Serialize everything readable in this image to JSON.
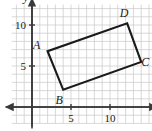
{
  "figure": {
    "type": "coordinate-grid-geometry",
    "axis_labels": {
      "x": "x",
      "y": "y"
    },
    "x_ticks": [
      {
        "value": 5,
        "label": "5"
      },
      {
        "value": 10,
        "label": "10"
      }
    ],
    "y_ticks": [
      {
        "value": 5,
        "label": "5"
      },
      {
        "value": 10,
        "label": "10"
      }
    ],
    "grid": true,
    "grid_color": "#c9c9c9",
    "axis_color": "#3a3a3a",
    "shape_color": "#1a1a1a",
    "shape": {
      "name": "rectangle ABCD",
      "vertices": [
        {
          "label": "A",
          "x": 2.0,
          "y": 6.8,
          "label_dx": -11,
          "label_dy": -2
        },
        {
          "label": "B",
          "x": 4.0,
          "y": 2.1,
          "label_dx": -4,
          "label_dy": 14
        },
        {
          "label": "C",
          "x": 14.0,
          "y": 5.5,
          "label_dx": 4,
          "label_dy": 4
        },
        {
          "label": "D",
          "x": 12.2,
          "y": 10.2,
          "label_dx": -3,
          "label_dy": -6
        }
      ]
    },
    "view": {
      "x_range": [
        -2.6,
        15.4
      ],
      "y_range": [
        -2.0,
        12.5
      ],
      "origin_px": [
        32,
        107
      ],
      "unit_px_x": 7.8,
      "unit_px_y": 8.2
    }
  }
}
